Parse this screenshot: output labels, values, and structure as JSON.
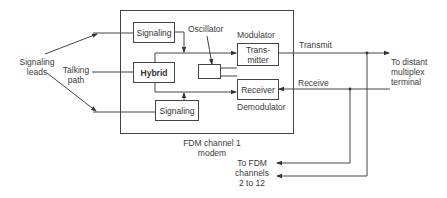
{
  "diagram": {
    "type": "block-diagram",
    "title": "FDM channel 1 modem",
    "container": {
      "label_line1": "FDM channel 1",
      "label_line2": "modem"
    },
    "blocks": {
      "signaling_top": "Signaling",
      "hybrid": "Hybrid",
      "signaling_bottom": "Signaling",
      "oscillator": "",
      "transmitter_line1": "Trans-",
      "transmitter_line2": "mitter",
      "receiver": "Receiver"
    },
    "labels": {
      "signaling_leads_line1": "Signaling",
      "signaling_leads_line2": "leads",
      "talking_path_line1": "Talking",
      "talking_path_line2": "path",
      "oscillator": "Oscillator",
      "modulator": "Modulator",
      "demodulator": "Demodulator",
      "transmit": "Transmit",
      "receive": "Receive",
      "distant_line1": "To distant",
      "distant_line2": "multiplex",
      "distant_line3": "terminal",
      "fdm_line1": "To FDM",
      "fdm_line2": "channels",
      "fdm_line3": "2 to 12"
    },
    "colors": {
      "line": "#444444",
      "text": "#3a3a3a",
      "background": "#ffffff"
    }
  }
}
